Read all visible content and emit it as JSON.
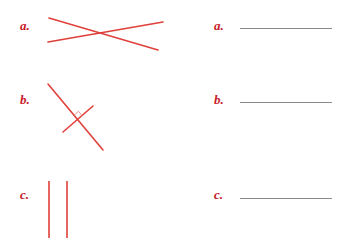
{
  "colors": {
    "accent": "#c8202a",
    "figure_stroke": "#e0403a",
    "answer_line": "#8a8a8a",
    "background": "#ffffff"
  },
  "figures": [
    {
      "label": "a.",
      "kind": "intersecting-lines",
      "lines": [
        {
          "x1": 49,
          "y1": 18,
          "x2": 158,
          "y2": 50
        },
        {
          "x1": 48,
          "y1": 42,
          "x2": 163,
          "y2": 22
        }
      ]
    },
    {
      "label": "b.",
      "kind": "perpendicular-lines",
      "lines": [
        {
          "x1": 48,
          "y1": 84,
          "x2": 103,
          "y2": 150
        },
        {
          "x1": 63,
          "y1": 132,
          "x2": 93,
          "y2": 106
        }
      ],
      "right_angle_marker": true
    },
    {
      "label": "c.",
      "kind": "parallel-lines",
      "lines": [
        {
          "x1": 49,
          "y1": 181,
          "x2": 49,
          "y2": 238
        },
        {
          "x1": 67,
          "y1": 181,
          "x2": 67,
          "y2": 238
        }
      ]
    }
  ],
  "answers": [
    {
      "label": "a.",
      "value": ""
    },
    {
      "label": "b.",
      "value": ""
    },
    {
      "label": "c.",
      "value": ""
    }
  ]
}
